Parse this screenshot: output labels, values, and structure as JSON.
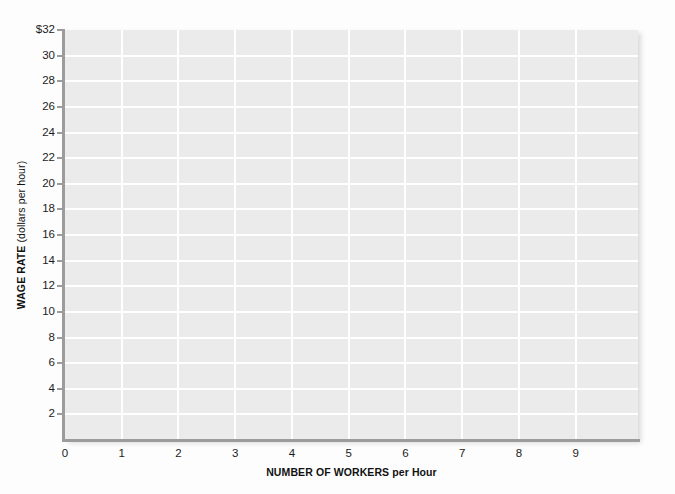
{
  "chart_data": {
    "type": "line",
    "title": "",
    "subtitle": "",
    "xlabel_bold": "NUMBER OF WORKERS",
    "xlabel_regular": " per Hour",
    "xlabel_full": "NUMBER OF WORKERS per Hour",
    "ylabel_bold": "WAGE RATE",
    "ylabel_regular": " (dollars per hour)",
    "ylabel_full": "WAGE RATE (dollars per hour)",
    "x_tick_labels": [
      "0",
      "1",
      "2",
      "3",
      "4",
      "5",
      "6",
      "7",
      "8",
      "9"
    ],
    "x_tick_values": [
      0,
      1,
      2,
      3,
      4,
      5,
      6,
      7,
      8,
      9
    ],
    "y_tick_labels": [
      "$32",
      "30",
      "28",
      "26",
      "24",
      "22",
      "20",
      "18",
      "16",
      "14",
      "12",
      "10",
      "8",
      "6",
      "4",
      "2"
    ],
    "y_tick_values": [
      32,
      30,
      28,
      26,
      24,
      22,
      20,
      18,
      16,
      14,
      12,
      10,
      8,
      6,
      4,
      2
    ],
    "xlim": [
      0,
      10.1
    ],
    "ylim": [
      0,
      32
    ],
    "grid": true,
    "grid_x_values": [
      1,
      2,
      3,
      4,
      5,
      6,
      7,
      8,
      9
    ],
    "grid_y_values": [
      2,
      4,
      6,
      8,
      10,
      12,
      14,
      16,
      18,
      20,
      22,
      24,
      26,
      28,
      30
    ],
    "legend": [],
    "series": [],
    "annotations": [],
    "colors": {
      "plot_background": "#ebebeb",
      "page_background": "#fdfdfd",
      "gridline": "#ffffff",
      "axis_line": "#9c9c9c",
      "tick_text": "#1c1c1c",
      "axis_title_text": "#111111"
    }
  }
}
